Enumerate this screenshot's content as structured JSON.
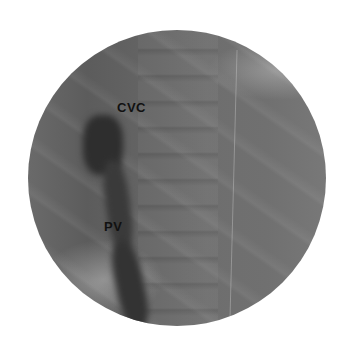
{
  "image": {
    "description": "Circular fluoroscopic (X-ray) image",
    "labels": [
      {
        "text": "CVC"
      },
      {
        "text": "PV"
      }
    ]
  }
}
